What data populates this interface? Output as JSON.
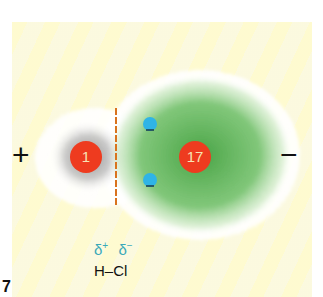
{
  "figure": {
    "number": "7",
    "formula": "H–Cl",
    "partial_charges": {
      "positive": "δ",
      "positive_sup": "+",
      "negative": "δ",
      "negative_sup": "−"
    },
    "poles": {
      "left": "+",
      "right": "−"
    },
    "nuclei": [
      {
        "element": "H",
        "label": "1"
      },
      {
        "element": "Cl",
        "label": "17"
      }
    ],
    "electrons": 2,
    "colors": {
      "background": "#fdfbdc",
      "nucleus": "#ee3b1f",
      "hydrogen_cloud": "#9a9a9a",
      "chlorine_cloud": "#4fae4a",
      "electron": "#2fb4e6",
      "divider": "#d9731e",
      "delta_text": "#3aa9b8"
    }
  }
}
